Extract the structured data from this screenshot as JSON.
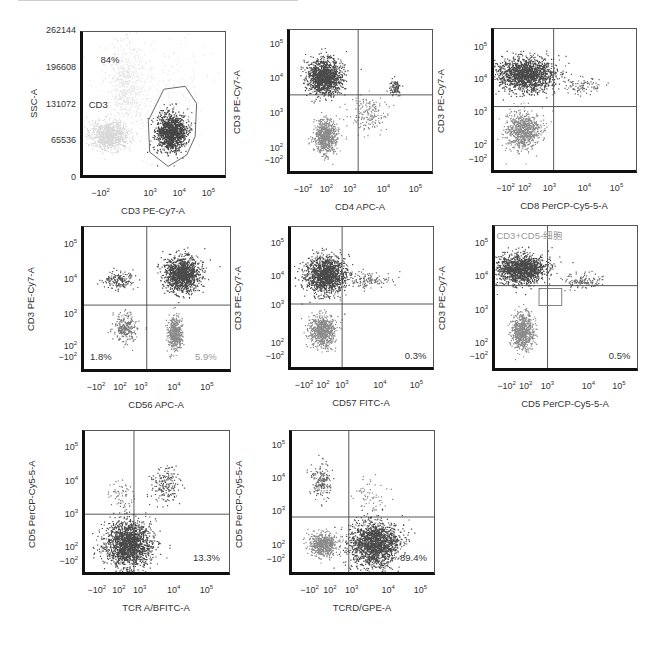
{
  "chart_data": [
    {
      "type": "scatter",
      "id": "p1",
      "xlabel": "CD3 PE-Cy7-A",
      "ylabel": "SSC-A",
      "xticks": [
        "-10^2",
        "10^3",
        "10^4",
        "10^5"
      ],
      "yticks": [
        "262144",
        "196608",
        "131072",
        "65536",
        "0"
      ],
      "ylim": [
        0,
        262144
      ],
      "gate": {
        "name": "CD3",
        "percent": "84%",
        "shape": "polygon"
      },
      "annotations": [
        {
          "text": "84%",
          "pos": "upper-left"
        },
        {
          "text": "CD3",
          "pos": "mid-left"
        }
      ],
      "populations": [
        {
          "name": "CD3- cells (light)",
          "x_center": "~10^2",
          "y_center": "~55000"
        },
        {
          "name": "CD3+ gated (dark)",
          "x_center": "~5x10^3",
          "y_center": "~70000"
        }
      ]
    },
    {
      "type": "scatter",
      "id": "p2",
      "xlabel": "CD4 APC-A",
      "ylabel": "CD3 PE-Cy7-A",
      "xticks": [
        "-10^2",
        "10^2",
        "10^3",
        "10^4",
        "10^5"
      ],
      "yticks": [
        "10^5",
        "10^4",
        "10^3",
        "10^2",
        "-10^2"
      ],
      "quadrant": true,
      "populations": [
        {
          "name": "CD3+CD4-",
          "x_center": "~10^2",
          "y_center": "~10^4"
        },
        {
          "name": "CD3-CD4-",
          "x_center": "~10^2",
          "y_center": "~10^2"
        },
        {
          "name": "CD3+CD4+",
          "x_center": "~2x10^4",
          "y_center": "~6x10^3"
        }
      ]
    },
    {
      "type": "scatter",
      "id": "p3",
      "xlabel": "CD8 PerCP-Cy5-5-A",
      "ylabel": "CD3 PE-Cy7-A",
      "xticks": [
        "-10^2",
        "10^2",
        "10^3",
        "10^4",
        "10^5"
      ],
      "yticks": [
        "10^5",
        "10^4",
        "10^3",
        "10^2",
        "-10^2"
      ],
      "quadrant": true,
      "populations": [
        {
          "name": "CD3+CD8-",
          "x_center": "~10^2",
          "y_center": "~10^4"
        },
        {
          "name": "CD3-CD8-",
          "x_center": "~10^2",
          "y_center": "~10^2"
        }
      ]
    },
    {
      "type": "scatter",
      "id": "p4",
      "xlabel": "CD56 APC-A",
      "ylabel": "CD3 PE-Cy7-A",
      "xticks": [
        "-10^2",
        "10^2",
        "10^3",
        "10^4",
        "10^5"
      ],
      "yticks": [
        "10^5",
        "10^4",
        "10^3",
        "10^2",
        "-10^2"
      ],
      "quadrant": true,
      "annotations": [
        {
          "text": "1.8%",
          "pos": "lower-left",
          "color": "#333333"
        },
        {
          "text": "5.9%",
          "pos": "lower-right",
          "color": "#9a9a9a"
        }
      ],
      "populations": [
        {
          "name": "CD3+CD56+",
          "x_center": "~10^4",
          "y_center": "~10^4"
        },
        {
          "name": "CD3-CD56+",
          "x_center": "~10^4",
          "y_center": "~10^2"
        },
        {
          "name": "CD3+CD56-",
          "x_center": "~10^2",
          "y_center": "~10^4"
        },
        {
          "name": "CD3-CD56-",
          "x_center": "~10^2",
          "y_center": "~3x10^2"
        }
      ]
    },
    {
      "type": "scatter",
      "id": "p5",
      "xlabel": "CD57 FITC-A",
      "ylabel": "CD3 PE-Cy7-A",
      "xticks": [
        "-10^2",
        "10^2",
        "10^3",
        "10^4",
        "10^5"
      ],
      "yticks": [
        "10^5",
        "10^4",
        "10^3",
        "10^2",
        "-10^2"
      ],
      "quadrant": true,
      "annotations": [
        {
          "text": "0.3%",
          "pos": "lower-right"
        }
      ],
      "populations": [
        {
          "name": "CD3+CD57-",
          "x_center": "~10^2",
          "y_center": "~10^4"
        },
        {
          "name": "CD3-CD57-",
          "x_center": "~10^2",
          "y_center": "~10^2"
        }
      ]
    },
    {
      "type": "scatter",
      "id": "p6",
      "xlabel": "CD5 PerCP-Cy5-5-A",
      "ylabel": "CD3 PE-Cy7-A",
      "xticks": [
        "-10^2",
        "10^2",
        "10^3",
        "10^4",
        "10^5"
      ],
      "yticks": [
        "10^5",
        "10^4",
        "10^3",
        "10^2",
        "-10^2"
      ],
      "quadrant": true,
      "gate": {
        "name": "CD3+CD5-细胞",
        "shape": "rectangle"
      },
      "annotations": [
        {
          "text": "CD3+CD5-细胞",
          "pos": "upper-left",
          "color": "#9a9a9a"
        },
        {
          "text": "0.5%",
          "pos": "lower-right"
        }
      ],
      "populations": [
        {
          "name": "CD3+CD5-",
          "x_center": "~10^1",
          "y_center": "~10^4"
        },
        {
          "name": "CD3-CD5-",
          "x_center": "~10^1",
          "y_center": "~10^2"
        }
      ]
    },
    {
      "type": "scatter",
      "id": "p7",
      "xlabel": "TCR A/BFITC-A",
      "ylabel": "CD5 PerCP-Cy5-5-A",
      "xticks": [
        "-10^2",
        "10^2",
        "10^3",
        "10^4",
        "10^5"
      ],
      "yticks": [
        "10^5",
        "10^4",
        "10^3",
        "10^2",
        "-10^2"
      ],
      "quadrant": true,
      "annotations": [
        {
          "text": "13.3%",
          "pos": "lower-right"
        }
      ],
      "populations": [
        {
          "name": "CD5-TCRab-",
          "x_center": "~10^2",
          "y_center": "~10^2"
        },
        {
          "name": "CD5+TCRab+",
          "x_center": "~5x10^3",
          "y_center": "~10^4"
        }
      ]
    },
    {
      "type": "scatter",
      "id": "p8",
      "xlabel": "TCRD/GPE-A",
      "ylabel": "CD5 PerCP-Cy5-5-A",
      "xticks": [
        "-10^2",
        "10^2",
        "10^3",
        "10^4",
        "10^5"
      ],
      "yticks": [
        "10^5",
        "10^4",
        "10^3",
        "10^2",
        "-10^2"
      ],
      "quadrant": true,
      "annotations": [
        {
          "text": "89.4%",
          "pos": "lower-right"
        }
      ],
      "populations": [
        {
          "name": "CD5-TCRgd+",
          "x_center": "~3x10^3",
          "y_center": "~10^2"
        },
        {
          "name": "CD5-TCRgd-",
          "x_center": "~-10^1",
          "y_center": "~10^2"
        },
        {
          "name": "CD5+TCRgd-",
          "x_center": "~-10^1",
          "y_center": "~10^4"
        }
      ]
    }
  ],
  "panels": [
    {
      "x": 80,
      "y": 31,
      "w": 146,
      "h": 147,
      "xlabel": "CD3 PE-Cy7-A",
      "ylabel": "SSC-A",
      "yticks": [
        [
          "262144",
          0
        ],
        [
          "196608",
          0.25
        ],
        [
          "131072",
          0.5
        ],
        [
          "65536",
          0.75
        ],
        [
          "0",
          1
        ]
      ],
      "xticks": [
        [
          "−10",
          "2",
          0.14
        ],
        [
          "10",
          "3",
          0.48
        ],
        [
          "10",
          "4",
          0.68
        ],
        [
          "10",
          "5",
          0.88
        ]
      ],
      "qx": null,
      "qy": null,
      "clouds": [
        {
          "cx": 0.18,
          "cy": 0.72,
          "rx": 0.14,
          "ry": 0.1,
          "n": 900,
          "c": "#d8d8d8"
        },
        {
          "cx": 0.3,
          "cy": 0.35,
          "rx": 0.13,
          "ry": 0.28,
          "n": 500,
          "c": "#e4e4e4"
        },
        {
          "cx": 0.62,
          "cy": 0.7,
          "rx": 0.1,
          "ry": 0.13,
          "n": 1400,
          "c": "#454545"
        },
        {
          "cx": 0.55,
          "cy": 0.4,
          "rx": 0.4,
          "ry": 0.4,
          "n": 250,
          "c": "#e8e8e8"
        }
      ],
      "gatePoly": "0.46,0.62 0.57,0.4 0.72,0.38 0.8,0.5 0.79,0.73 0.73,0.86 0.6,0.94 0.47,0.84",
      "labels": [
        {
          "t": "84%",
          "x": 0.14,
          "y": 0.2,
          "c": "#333"
        },
        {
          "t": "CD3",
          "x": 0.06,
          "y": 0.5,
          "c": "#333"
        }
      ]
    },
    {
      "x": 287,
      "y": 29,
      "w": 146,
      "h": 145,
      "xlabel": "CD4 APC-A",
      "ylabel": "CD3 PE-Cy7-A",
      "yticks": [
        [
          "10",
          "5",
          0.1
        ],
        [
          "10",
          "4",
          0.34
        ],
        [
          "10",
          "3",
          0.58
        ],
        [
          "10",
          "2",
          0.82
        ],
        [
          "−10",
          "2",
          0.9
        ]
      ],
      "xticks": [
        [
          "−10",
          "2",
          0.11
        ],
        [
          "10",
          "2",
          0.27
        ],
        [
          "10",
          "3",
          0.43
        ],
        [
          "10",
          "4",
          0.66
        ],
        [
          "10",
          "5",
          0.88
        ]
      ],
      "qx": 0.48,
      "qy": 0.46,
      "clouds": [
        {
          "cx": 0.24,
          "cy": 0.33,
          "rx": 0.12,
          "ry": 0.12,
          "n": 1400,
          "c": "#4a4a4a"
        },
        {
          "cx": 0.25,
          "cy": 0.75,
          "rx": 0.08,
          "ry": 0.12,
          "n": 700,
          "c": "#8a8a8a"
        },
        {
          "cx": 0.74,
          "cy": 0.4,
          "rx": 0.04,
          "ry": 0.05,
          "n": 90,
          "c": "#555"
        },
        {
          "cx": 0.55,
          "cy": 0.6,
          "rx": 0.13,
          "ry": 0.12,
          "n": 180,
          "c": "#888"
        }
      ],
      "labels": []
    },
    {
      "x": 491,
      "y": 28,
      "w": 146,
      "h": 145,
      "xlabel": "CD8 PerCP-Cy5-5-A",
      "ylabel": "CD3 PE-Cy7-A",
      "yticks": [
        [
          "10",
          "5",
          0.13
        ],
        [
          "10",
          "4",
          0.35
        ],
        [
          "10",
          "3",
          0.58
        ],
        [
          "10",
          "2",
          0.81
        ],
        [
          "−10",
          "2",
          0.9
        ]
      ],
      "xticks": [
        [
          "−10",
          "2",
          0.1
        ],
        [
          "10",
          "2",
          0.23
        ],
        [
          "10",
          "3",
          0.4
        ],
        [
          "10",
          "4",
          0.64
        ],
        [
          "10",
          "5",
          0.86
        ]
      ],
      "qx": 0.42,
      "qy": 0.55,
      "clouds": [
        {
          "cx": 0.22,
          "cy": 0.32,
          "rx": 0.2,
          "ry": 0.12,
          "n": 1600,
          "c": "#4a4a4a"
        },
        {
          "cx": 0.2,
          "cy": 0.72,
          "rx": 0.12,
          "ry": 0.13,
          "n": 800,
          "c": "#8a8a8a"
        },
        {
          "cx": 0.62,
          "cy": 0.4,
          "rx": 0.14,
          "ry": 0.07,
          "n": 90,
          "c": "#666"
        }
      ],
      "labels": []
    },
    {
      "x": 81,
      "y": 226,
      "w": 150,
      "h": 146,
      "xlabel": "CD56 APC-A",
      "ylabel": "CD3 PE-Cy7-A",
      "yticks": [
        [
          "10",
          "5",
          0.12
        ],
        [
          "10",
          "4",
          0.36
        ],
        [
          "10",
          "3",
          0.6
        ],
        [
          "10",
          "2",
          0.82
        ],
        [
          "−10",
          "2",
          0.9
        ]
      ],
      "xticks": [
        [
          "−10",
          "2",
          0.1
        ],
        [
          "10",
          "2",
          0.26
        ],
        [
          "10",
          "3",
          0.4
        ],
        [
          "10",
          "4",
          0.62
        ],
        [
          "10",
          "5",
          0.84
        ]
      ],
      "qx": 0.43,
      "qy": 0.55,
      "clouds": [
        {
          "cx": 0.67,
          "cy": 0.33,
          "rx": 0.12,
          "ry": 0.12,
          "n": 1300,
          "c": "#4a4a4a"
        },
        {
          "cx": 0.62,
          "cy": 0.75,
          "rx": 0.05,
          "ry": 0.11,
          "n": 500,
          "c": "#8a8a8a"
        },
        {
          "cx": 0.24,
          "cy": 0.37,
          "rx": 0.1,
          "ry": 0.06,
          "n": 180,
          "c": "#555"
        },
        {
          "cx": 0.28,
          "cy": 0.7,
          "rx": 0.08,
          "ry": 0.1,
          "n": 250,
          "c": "#777"
        }
      ],
      "labels": [
        {
          "t": "1.8%",
          "x": 0.06,
          "y": 0.9,
          "c": "#333"
        },
        {
          "t": "5.9%",
          "x": 0.76,
          "y": 0.9,
          "c": "#9a9a9a"
        }
      ]
    },
    {
      "x": 288,
      "y": 226,
      "w": 146,
      "h": 144,
      "xlabel": "CD57 FITC-A",
      "ylabel": "CD3 PE-Cy7-A",
      "yticks": [
        [
          "10",
          "5",
          0.12
        ],
        [
          "10",
          "4",
          0.35
        ],
        [
          "10",
          "3",
          0.55
        ],
        [
          "10",
          "2",
          0.81
        ],
        [
          "−10",
          "2",
          0.9
        ]
      ],
      "xticks": [
        [
          "−10",
          "2",
          0.11
        ],
        [
          "10",
          "2",
          0.24
        ],
        [
          "10",
          "3",
          0.37
        ],
        [
          "10",
          "4",
          0.63
        ],
        [
          "10",
          "5",
          0.88
        ]
      ],
      "qx": 0.36,
      "qy": 0.55,
      "clouds": [
        {
          "cx": 0.24,
          "cy": 0.34,
          "rx": 0.14,
          "ry": 0.13,
          "n": 1400,
          "c": "#4a4a4a"
        },
        {
          "cx": 0.22,
          "cy": 0.74,
          "rx": 0.09,
          "ry": 0.12,
          "n": 700,
          "c": "#8a8a8a"
        },
        {
          "cx": 0.55,
          "cy": 0.38,
          "rx": 0.15,
          "ry": 0.06,
          "n": 120,
          "c": "#666"
        }
      ],
      "labels": [
        {
          "t": "0.3%",
          "x": 0.8,
          "y": 0.9,
          "c": "#333"
        }
      ]
    },
    {
      "x": 492,
      "y": 225,
      "w": 146,
      "h": 146,
      "xlabel": "CD5 PerCP-Cy5-5-A",
      "ylabel": "CD3 PE-Cy7-A",
      "yticks": [
        [
          "10",
          "5",
          0.12
        ],
        [
          "10",
          "4",
          0.35
        ],
        [
          "10",
          "3",
          0.58
        ],
        [
          "10",
          "2",
          0.81
        ],
        [
          "−10",
          "2",
          0.9
        ]
      ],
      "xticks": [
        [
          "−10",
          "2",
          0.1
        ],
        [
          "10",
          "2",
          0.23
        ],
        [
          "10",
          "3",
          0.38
        ],
        [
          "10",
          "4",
          0.66
        ],
        [
          "10",
          "5",
          0.87
        ]
      ],
      "qx": 0.37,
      "qy": 0.42,
      "clouds": [
        {
          "cx": 0.18,
          "cy": 0.3,
          "rx": 0.17,
          "ry": 0.1,
          "n": 1500,
          "c": "#4a4a4a"
        },
        {
          "cx": 0.19,
          "cy": 0.74,
          "rx": 0.08,
          "ry": 0.13,
          "n": 700,
          "c": "#8a8a8a"
        },
        {
          "cx": 0.6,
          "cy": 0.38,
          "rx": 0.15,
          "ry": 0.05,
          "n": 130,
          "c": "#666"
        }
      ],
      "gateRect": [
        0.31,
        0.44,
        0.16,
        0.12
      ],
      "labels": [
        {
          "t": "CD3+CD5-细胞",
          "x": 0.03,
          "y": 0.06,
          "c": "#9a9a9a"
        },
        {
          "t": "0.5%",
          "x": 0.8,
          "y": 0.9,
          "c": "#333"
        }
      ]
    },
    {
      "x": 82,
      "y": 430,
      "w": 148,
      "h": 145,
      "xlabel": "TCR A/BFITC-A",
      "ylabel": "CD5 PerCP-Cy5-5-A",
      "yticks": [
        [
          "10",
          "5",
          0.12
        ],
        [
          "10",
          "4",
          0.35
        ],
        [
          "10",
          "3",
          0.58
        ],
        [
          "10",
          "2",
          0.81
        ],
        [
          "−10",
          "2",
          0.9
        ]
      ],
      "xticks": [
        [
          "−10",
          "2",
          0.1
        ],
        [
          "10",
          "2",
          0.25
        ],
        [
          "10",
          "3",
          0.39
        ],
        [
          "10",
          "4",
          0.62
        ],
        [
          "10",
          "5",
          0.84
        ]
      ],
      "qx": 0.34,
      "qy": 0.59,
      "clouds": [
        {
          "cx": 0.3,
          "cy": 0.8,
          "rx": 0.16,
          "ry": 0.16,
          "n": 1800,
          "c": "#4a4a4a"
        },
        {
          "cx": 0.55,
          "cy": 0.38,
          "rx": 0.1,
          "ry": 0.12,
          "n": 180,
          "c": "#555"
        },
        {
          "cx": 0.25,
          "cy": 0.45,
          "rx": 0.08,
          "ry": 0.12,
          "n": 60,
          "c": "#777"
        }
      ],
      "labels": [
        {
          "t": "13.3%",
          "x": 0.75,
          "y": 0.88,
          "c": "#333"
        }
      ]
    },
    {
      "x": 289,
      "y": 430,
      "w": 146,
      "h": 145,
      "xlabel": "TCRD/GPE-A",
      "ylabel": "CD5 PerCP-Cy5-5-A",
      "yticks": [
        [
          "10",
          "5",
          0.1
        ],
        [
          "10",
          "4",
          0.33
        ],
        [
          "10",
          "3",
          0.56
        ],
        [
          "10",
          "2",
          0.79
        ],
        [
          "−10",
          "2",
          0.89
        ]
      ],
      "xticks": [
        [
          "−10",
          "2",
          0.14
        ],
        [
          "10",
          "2",
          0.28
        ],
        [
          "10",
          "3",
          0.43
        ],
        [
          "10",
          "4",
          0.68
        ],
        [
          "10",
          "5",
          0.9
        ]
      ],
      "qx": 0.4,
      "qy": 0.61,
      "clouds": [
        {
          "cx": 0.58,
          "cy": 0.8,
          "rx": 0.17,
          "ry": 0.16,
          "n": 1700,
          "c": "#4a4a4a"
        },
        {
          "cx": 0.22,
          "cy": 0.8,
          "rx": 0.1,
          "ry": 0.08,
          "n": 600,
          "c": "#8a8a8a"
        },
        {
          "cx": 0.2,
          "cy": 0.35,
          "rx": 0.07,
          "ry": 0.13,
          "n": 180,
          "c": "#666"
        },
        {
          "cx": 0.55,
          "cy": 0.45,
          "rx": 0.12,
          "ry": 0.12,
          "n": 60,
          "c": "#888"
        }
      ],
      "labels": [
        {
          "t": "89.4%",
          "x": 0.76,
          "y": 0.88,
          "c": "#333"
        }
      ]
    }
  ]
}
